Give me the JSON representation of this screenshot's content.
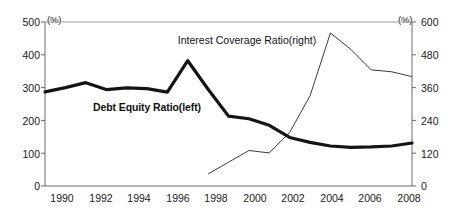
{
  "chart_data": {
    "type": "line",
    "title": "",
    "xlabel": "",
    "grid": false,
    "legend_position": "inline-annotation",
    "x": [
      1990,
      1991,
      1992,
      1993,
      1994,
      1995,
      1996,
      1997,
      1998,
      1999,
      2000,
      2001,
      2002,
      2003,
      2004,
      2005,
      2006,
      2007,
      2008
    ],
    "xlim": [
      1990,
      2008
    ],
    "xticks": [
      "1990",
      "1992",
      "1994",
      "1996",
      "1998",
      "2000",
      "2002",
      "2004",
      "2006",
      "2008"
    ],
    "left_axis": {
      "unit": "(%)",
      "ylabel": "",
      "ylim": [
        0,
        500
      ],
      "ticks": [
        "0",
        "100",
        "200",
        "300",
        "400",
        "500"
      ]
    },
    "right_axis": {
      "unit": "(%)",
      "ylabel": "",
      "ylim": [
        0,
        600
      ],
      "ticks": [
        "0",
        "120",
        "240",
        "360",
        "480",
        "600"
      ]
    },
    "series": [
      {
        "name": "Debt  Equity Ratio(left)",
        "axis": "left",
        "style": "thick",
        "color": "#141414",
        "x": [
          1990,
          1991,
          1992,
          1993,
          1994,
          1995,
          1996,
          1997,
          1998,
          1999,
          2000,
          2001,
          2002,
          2003,
          2004,
          2005,
          2006,
          2007,
          2008
        ],
        "values": [
          287,
          300,
          315,
          294,
          299,
          297,
          286,
          382,
          295,
          213,
          205,
          185,
          148,
          133,
          122,
          118,
          119,
          122,
          131
        ],
        "label_position": {
          "x": 147,
          "y": 107
        }
      },
      {
        "name": "Interest Coverage Ratio(right)",
        "axis": "right",
        "style": "thin",
        "color": "#3a3a3a",
        "x": [
          1998,
          1999,
          2000,
          2001,
          2002,
          2003,
          2004,
          2005,
          2006,
          2007,
          2008
        ],
        "values": [
          44,
          87,
          130,
          121,
          196,
          330,
          560,
          500,
          425,
          418,
          400
        ],
        "label_position": {
          "x": 247,
          "y": 40
        }
      }
    ]
  },
  "axes": {
    "left_unit": "(%)",
    "right_unit": "(%)",
    "left_ticks": [
      "500",
      "400",
      "300",
      "200",
      "100",
      "0"
    ],
    "right_ticks": [
      "600",
      "480",
      "360",
      "240",
      "120",
      "0"
    ],
    "x_ticks": [
      "1990",
      "1992",
      "1994",
      "1996",
      "1998",
      "2000",
      "2002",
      "2004",
      "2006",
      "2008"
    ]
  },
  "labels": {
    "series_thick": "Debt  Equity Ratio(left)",
    "series_thin": "Interest Coverage Ratio(right)"
  }
}
